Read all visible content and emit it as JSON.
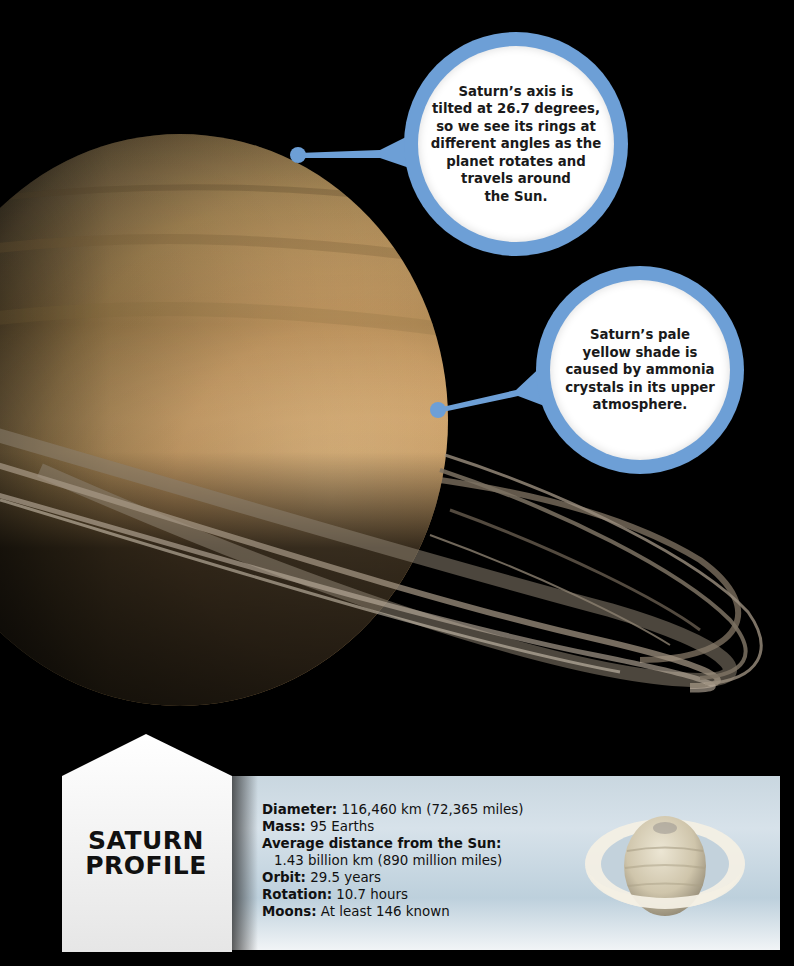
{
  "page": {
    "background_color": "#000000",
    "accent_color": "#6d9fd6"
  },
  "callouts": [
    {
      "text": "Saturn’s axis is\ntilted at 26.7 degrees,\nso we see its rings at\ndifferent angles as the\nplanet rotates and\ntravels around\nthe Sun.",
      "pointer_target": "top edge of Saturn"
    },
    {
      "text": "Saturn’s pale\nyellow shade is\ncaused by ammonia\ncrystals in its upper\natmosphere.",
      "pointer_target": "right edge of Saturn"
    }
  ],
  "profile": {
    "title_line1": "SATURN",
    "title_line2": "PROFILE",
    "facts": [
      {
        "label": "Diameter:",
        "value": " 116,460 km (72,365 miles)"
      },
      {
        "label": "Mass:",
        "value": " 95 Earths"
      },
      {
        "label": "Average distance from the Sun:",
        "value": ""
      },
      {
        "label": "",
        "value": "1.43 billion km (890 million miles)"
      },
      {
        "label": "Orbit:",
        "value": " 29.5 years"
      },
      {
        "label": "Rotation:",
        "value": " 10.7 hours"
      },
      {
        "label": "Moons:",
        "value": " At least 146 known"
      }
    ]
  }
}
